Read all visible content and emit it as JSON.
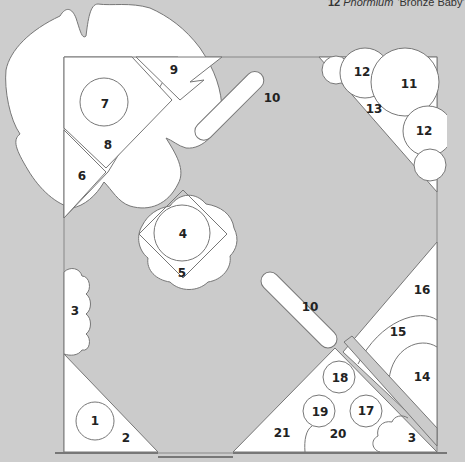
{
  "caption": {
    "number": "12",
    "genus": "Phormium",
    "cultivar": "'Bronze Baby'"
  },
  "colors": {
    "background": "#cdcdcd",
    "paving": "#cbcbcb",
    "bed": "#ffffff",
    "outline": "#777777",
    "wall": "#888888"
  },
  "plan": {
    "labels": [
      {
        "id": "1",
        "text": "1"
      },
      {
        "id": "2",
        "text": "2"
      },
      {
        "id": "3a",
        "text": "3"
      },
      {
        "id": "3b",
        "text": "3"
      },
      {
        "id": "4",
        "text": "4"
      },
      {
        "id": "5",
        "text": "5"
      },
      {
        "id": "6",
        "text": "6"
      },
      {
        "id": "7",
        "text": "7"
      },
      {
        "id": "8",
        "text": "8"
      },
      {
        "id": "9",
        "text": "9"
      },
      {
        "id": "10a",
        "text": "10"
      },
      {
        "id": "10b",
        "text": "10"
      },
      {
        "id": "11",
        "text": "11"
      },
      {
        "id": "12a",
        "text": "12"
      },
      {
        "id": "12b",
        "text": "12"
      },
      {
        "id": "13",
        "text": "13"
      },
      {
        "id": "14",
        "text": "14"
      },
      {
        "id": "15",
        "text": "15"
      },
      {
        "id": "16",
        "text": "16"
      },
      {
        "id": "17",
        "text": "17"
      },
      {
        "id": "18",
        "text": "18"
      },
      {
        "id": "19",
        "text": "19"
      },
      {
        "id": "20",
        "text": "20"
      },
      {
        "id": "21",
        "text": "21"
      }
    ]
  }
}
